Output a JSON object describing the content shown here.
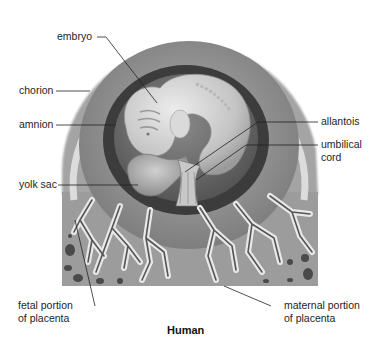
{
  "figure": {
    "title": "Human"
  },
  "labels": {
    "embryo": "embryo",
    "chorion": "chorion",
    "amnion": "amnion",
    "yolk_sac": "yolk sac",
    "allantois": "allantois",
    "umbilical_cord_line1": "umbilical",
    "umbilical_cord_line2": "cord",
    "fetal_placenta_line1": "fetal portion",
    "fetal_placenta_line2": "of placenta",
    "maternal_placenta_line1": "maternal portion",
    "maternal_placenta_line2": "of placenta"
  },
  "colors": {
    "outer_tissue": "#9a9a9a",
    "chorion_band": "#d6d6d6",
    "chorionic_cavity": "#8c8c8c",
    "amnion_ring": "#3e3e3e",
    "amniotic_fluid": "#6a6a6a",
    "embryo": "#cfcfcf",
    "yolk_sac": "#b4b4b4",
    "villi": "#5a5a5a",
    "villi_halo": "#e6e6e6",
    "leader_line": "#222222",
    "text": "#1e1e1e"
  }
}
